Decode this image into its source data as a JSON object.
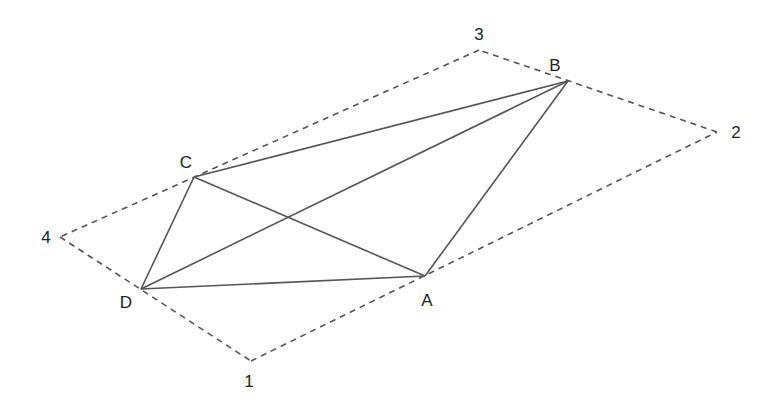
{
  "diagram": {
    "type": "geometry",
    "colors": {
      "solid_line": "#555555",
      "dashed_line": "#555555",
      "label": "#222222",
      "background": "#ffffff"
    },
    "outer_points": [
      {
        "id": "1",
        "label": "1",
        "x": 251,
        "y": 361,
        "label_x": 249,
        "label_y": 381
      },
      {
        "id": "2",
        "label": "2",
        "x": 717,
        "y": 132,
        "label_x": 736,
        "label_y": 132
      },
      {
        "id": "3",
        "label": "3",
        "x": 479,
        "y": 50,
        "label_x": 479,
        "label_y": 34
      },
      {
        "id": "4",
        "label": "4",
        "x": 60,
        "y": 237,
        "label_x": 46,
        "label_y": 237
      }
    ],
    "inner_points": [
      {
        "id": "A",
        "label": "A",
        "x": 425,
        "y": 276,
        "label_x": 427,
        "label_y": 300
      },
      {
        "id": "B",
        "label": "B",
        "x": 568,
        "y": 81,
        "label_x": 555,
        "label_y": 65
      },
      {
        "id": "C",
        "label": "C",
        "x": 194,
        "y": 177,
        "label_x": 186,
        "label_y": 162
      },
      {
        "id": "D",
        "label": "D",
        "x": 141,
        "y": 289,
        "label_x": 126,
        "label_y": 302
      }
    ],
    "dashed_edges": [
      [
        "1",
        "2"
      ],
      [
        "2",
        "3"
      ],
      [
        "3",
        "4"
      ],
      [
        "4",
        "1"
      ]
    ],
    "solid_edges": [
      [
        "A",
        "B"
      ],
      [
        "B",
        "C"
      ],
      [
        "C",
        "D"
      ],
      [
        "D",
        "A"
      ],
      [
        "A",
        "C"
      ],
      [
        "B",
        "D"
      ]
    ]
  }
}
